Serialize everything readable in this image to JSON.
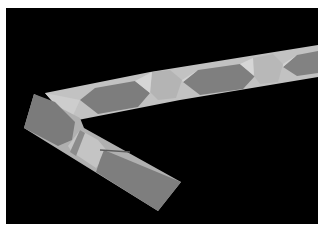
{
  "image": {
    "subject": "folded paper strip tessellation",
    "description": "Grayscale photograph of a long folded paper strip forming an L/V shape against a black background, with alternating dark hexagonal panels and light twisted folds.",
    "colors": {
      "page_border": "#ffffff",
      "background": "#000000",
      "paper_dark": "#7a7a7a",
      "paper_mid": "#9a9a9a",
      "paper_light": "#c4c4c4",
      "paper_highlight": "#d8d8d8"
    }
  }
}
